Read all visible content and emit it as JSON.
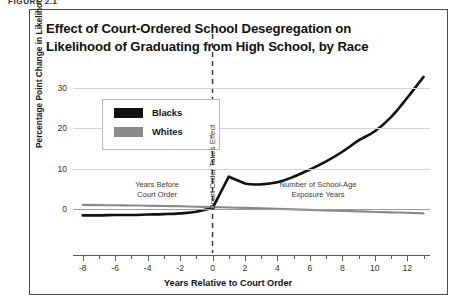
{
  "figure": {
    "number_label": "FIGURE 2.1",
    "title_line1": "Effect of Court-Ordered School Desegregation on",
    "title_line2": "Likelihood of Graduating from High School, by Race"
  },
  "legend": {
    "position": "upper-left-inside",
    "items": [
      {
        "label": "Blacks",
        "color": "#111111"
      },
      {
        "label": "Whites",
        "color": "#8a8a8a"
      }
    ]
  },
  "annotations": {
    "before": "Years Before\nCourt Order",
    "after": "Number of School-Age\nExposure Years",
    "court_line": "Court Order Takes Effect"
  },
  "axes": {
    "y_label": "Percentage Point Change in\nLikelihood of Graduation",
    "y_ticks": [
      "0",
      "10",
      "20",
      "30"
    ],
    "x_label": "Years Relative to Court Order",
    "x_ticks": [
      "-8",
      "-6",
      "-4",
      "-2",
      "0",
      "2",
      "4",
      "6",
      "8",
      "10",
      "12"
    ]
  },
  "chart_data": {
    "type": "line",
    "title": "Effect of Court-Ordered School Desegregation on Likelihood of Graduating from High School, by Race",
    "xlabel": "Years Relative to Court Order",
    "ylabel": "Percentage Point Change in Likelihood of Graduation",
    "xlim": [
      -8.6,
      13.4
    ],
    "ylim": [
      -3.5,
      34
    ],
    "y_ticks": [
      0,
      10,
      20,
      30
    ],
    "x_ticks": [
      -8,
      -6,
      -4,
      -2,
      0,
      2,
      4,
      6,
      8,
      10,
      12
    ],
    "x_minor_ticks": [
      -7,
      -5,
      -3,
      -1,
      1,
      3,
      5,
      7,
      9,
      11,
      13
    ],
    "grid": "horizontal",
    "zero_line": 0,
    "vline": {
      "x": 0,
      "style": "dashed",
      "label": "Court Order Takes Effect"
    },
    "x": [
      -8,
      -7,
      -6,
      -5,
      -4,
      -3,
      -2,
      -1,
      0,
      1,
      2,
      3,
      4,
      5,
      6,
      7,
      8,
      9,
      10,
      11,
      12,
      13
    ],
    "series": [
      {
        "name": "Blacks",
        "color": "#111111",
        "values": [
          -1.6,
          -1.6,
          -1.5,
          -1.5,
          -1.4,
          -1.3,
          -1.1,
          -0.7,
          0.2,
          8.0,
          6.3,
          6.1,
          6.6,
          8.0,
          9.8,
          11.8,
          14.2,
          17.0,
          19.3,
          22.8,
          27.6,
          32.8
        ]
      },
      {
        "name": "Whites",
        "color": "#8a8a8a",
        "values": [
          1.0,
          0.95,
          0.9,
          0.85,
          0.8,
          0.72,
          0.65,
          0.55,
          0.45,
          0.35,
          0.25,
          0.12,
          0.0,
          -0.12,
          -0.25,
          -0.38,
          -0.5,
          -0.62,
          -0.75,
          -0.85,
          -0.95,
          -1.1
        ]
      }
    ]
  }
}
